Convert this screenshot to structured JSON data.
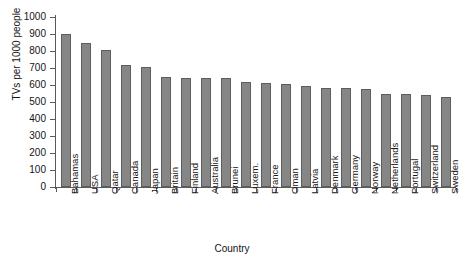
{
  "chart_data": {
    "type": "bar",
    "title": "",
    "xlabel": "Country",
    "ylabel": "TVs per 1000 people",
    "ylim": [
      0,
      1000
    ],
    "ytick_step": 100,
    "yticks": [
      1000,
      900,
      800,
      700,
      600,
      500,
      400,
      300,
      200,
      100,
      0
    ],
    "grid": false,
    "legend": null,
    "bar_color": "#868686",
    "bar_edge_color": "#5d5d5d",
    "axis_color": "#5a5a5a",
    "background": "#ffffff",
    "categories": [
      "Bahamas",
      "USA",
      "Qatar",
      "Canada",
      "Japan",
      "Britain",
      "Finland",
      "Australia",
      "Brunei",
      "Luxem.",
      "France",
      "Oman",
      "Latvia",
      "Denmark",
      "Germany",
      "Norway",
      "Netherlands",
      "Portugal",
      "Switzerland",
      "Sweden"
    ],
    "values": [
      900,
      850,
      805,
      715,
      705,
      645,
      640,
      640,
      640,
      620,
      610,
      605,
      595,
      585,
      580,
      575,
      550,
      545,
      540,
      530
    ],
    "series": [
      {
        "name": "TVs per 1000 people",
        "values": [
          900,
          850,
          805,
          715,
          705,
          645,
          640,
          640,
          640,
          620,
          610,
          605,
          595,
          585,
          580,
          575,
          550,
          545,
          540,
          530
        ]
      }
    ]
  }
}
